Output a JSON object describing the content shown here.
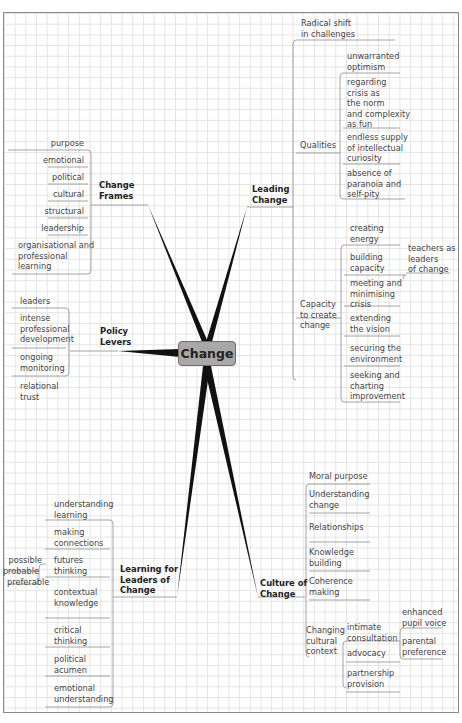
{
  "central": {
    "label": "Change"
  },
  "branches": {
    "change_frames": {
      "label_l1": "Change",
      "label_l2": "Frames",
      "items": [
        "purpose",
        "emotional",
        "political",
        "cultural",
        "structural",
        "leadership"
      ],
      "last_item": {
        "l1": "organisational and",
        "l2": "professional",
        "l3": "learning"
      }
    },
    "leading_change": {
      "label_l1": "Leading",
      "label_l2": "Change",
      "radical": {
        "l1": "Radical shift",
        "l2": "in challenges"
      },
      "qualities": {
        "label": "Qualities",
        "items": [
          {
            "l1": "unwarranted",
            "l2": "optimism"
          },
          {
            "l1": "regarding",
            "l2": "crisis as",
            "l3": "the norm",
            "l4": "and complexity",
            "l5": "as fun"
          },
          {
            "l1": "endless supply",
            "l2": "of intellectual",
            "l3": "curiosity"
          },
          {
            "l1": "absence of",
            "l2": "paranoia and",
            "l3": "self-pity"
          }
        ]
      },
      "capacity": {
        "l1": "Capacity",
        "l2": "to create",
        "l3": "change",
        "items": [
          {
            "l1": "creating",
            "l2": "energy"
          },
          {
            "l1": "building",
            "l2": "capacity"
          },
          {
            "l1": "meeting and",
            "l2": "minimising",
            "l3": "crisis"
          },
          {
            "l1": "extending",
            "l2": "the vision"
          },
          {
            "l1": "securing the",
            "l2": "environment"
          },
          {
            "l1": "seeking and",
            "l2": "charting",
            "l3": "improvement"
          }
        ],
        "teachers": {
          "l1": "teachers as",
          "l2": "leaders",
          "l3": "of change"
        }
      }
    },
    "policy_levers": {
      "label_l1": "Policy",
      "label_l2": "Levers",
      "items": [
        {
          "l1": "leaders"
        },
        {
          "l1": "intense",
          "l2": "professional",
          "l3": "development"
        },
        {
          "l1": "ongoing",
          "l2": "monitoring"
        },
        {
          "l1": "relational",
          "l2": "trust"
        }
      ]
    },
    "learning_leaders": {
      "label_l1": "Learning for",
      "label_l2": "Leaders of",
      "label_l3": "Change",
      "items": [
        {
          "l1": "understanding",
          "l2": "learning"
        },
        {
          "l1": "making",
          "l2": "connections"
        },
        {
          "l1": "futures",
          "l2": "thinking"
        },
        {
          "l1": "contextual",
          "l2": "knowledge"
        },
        {
          "l1": "critical",
          "l2": "thinking"
        },
        {
          "l1": "political",
          "l2": "acumen"
        },
        {
          "l1": "emotional",
          "l2": "understanding"
        }
      ],
      "futures_sub": [
        "possible",
        "probable",
        "preferable"
      ]
    },
    "culture_change": {
      "label_l1": "Culture of",
      "label_l2": "Change",
      "items": [
        {
          "l1": "Moral purpose"
        },
        {
          "l1": "Understanding",
          "l2": "change"
        },
        {
          "l1": "Relationships"
        },
        {
          "l1": "Knowledge",
          "l2": "building"
        },
        {
          "l1": "Coherence",
          "l2": "making"
        }
      ],
      "changing": {
        "l1": "Changing",
        "l2": "cultural",
        "l3": "context",
        "items": [
          {
            "l1": "intimate",
            "l2": "consultation"
          },
          {
            "l1": "advocacy"
          },
          {
            "l1": "partnership",
            "l2": "provision"
          }
        ],
        "consultation_sub": [
          {
            "l1": "enhanced",
            "l2": "pupil voice"
          },
          {
            "l1": "parental",
            "l2": "preference"
          }
        ]
      }
    }
  },
  "colors": {
    "grid": "#e4e4e4",
    "border": "#8a8a8a",
    "line": "#9a9a9a",
    "spike": "#111111",
    "center_fill": "#a8a8a8",
    "text": "#444444"
  }
}
